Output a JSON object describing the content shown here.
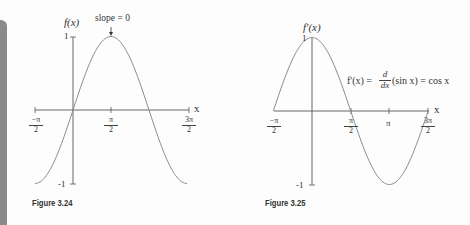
{
  "chart_data": [
    {
      "type": "line",
      "figure_label": "Figure 3.24",
      "function": "f(x) = sin x",
      "ylabel": "f(x)",
      "xlabel": "x",
      "x_ticks": [
        "-π/2",
        "π/2",
        "3π/2"
      ],
      "y_ticks": [
        "1",
        "-1"
      ],
      "xlim": [
        -1.5708,
        4.7124
      ],
      "ylim": [
        -1,
        1
      ],
      "annotation": {
        "text": "slope = 0",
        "x": 1.5708,
        "y": 1
      },
      "series": [
        {
          "name": "sin x",
          "x": [
            -1.5708,
            -0.7854,
            0,
            0.7854,
            1.5708,
            2.3562,
            3.1416,
            3.927,
            4.7124
          ],
          "y": [
            -1,
            -0.707,
            0,
            0.707,
            1,
            0.707,
            0,
            -0.707,
            -1
          ]
        }
      ],
      "grid": false
    },
    {
      "type": "line",
      "figure_label": "Figure 3.25",
      "function": "f'(x) = d/dx (sin x) = cos x",
      "ylabel": "f'(x)",
      "xlabel": "x",
      "x_ticks": [
        "-π/2",
        "π/2",
        "π",
        "3π/2"
      ],
      "y_ticks": [
        "1",
        "-1"
      ],
      "xlim": [
        -1.5708,
        4.7124
      ],
      "ylim": [
        -1,
        1
      ],
      "annotation": {
        "text": "f'(x) = d/dx (sin x) = cos x"
      },
      "series": [
        {
          "name": "cos x",
          "x": [
            -1.5708,
            -0.7854,
            0,
            0.7854,
            1.5708,
            2.3562,
            3.1416,
            3.927,
            4.7124
          ],
          "y": [
            0,
            0.707,
            1,
            0.707,
            0,
            -0.707,
            -1,
            -0.707,
            0
          ]
        }
      ],
      "grid": false
    }
  ],
  "fig1": {
    "caption": "Figure 3.24",
    "ylabel": "f(x)",
    "xlabel": "x",
    "y_top": "1",
    "y_bottom": "-1",
    "slope_label": "slope = 0",
    "ticks": [
      {
        "num": "−π",
        "den": "2"
      },
      {
        "num": "π",
        "den": "2"
      },
      {
        "num": "3π",
        "den": "2"
      }
    ]
  },
  "fig2": {
    "caption": "Figure 3.25",
    "ylabel": "f'(x)",
    "xlabel": "x",
    "y_top": "1",
    "y_bottom": "-1",
    "formula_lhs": "f'(x) =",
    "formula_d_num": "d",
    "formula_d_den": "dx",
    "formula_rhs": "(sin x) = cos x",
    "ticks": [
      {
        "num": "−π",
        "den": "2"
      },
      {
        "num": "π",
        "den": "2"
      },
      {
        "num": "3π",
        "den": "2"
      }
    ],
    "pi_label": "π"
  },
  "colors": {
    "curve": "#8c8c8c",
    "axis": "#555555",
    "sidebar": "#8a8a8a"
  }
}
